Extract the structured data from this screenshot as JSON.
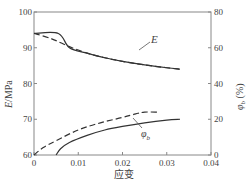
{
  "chart_data": {
    "type": "line",
    "title": "",
    "xlabel": "应变",
    "ylabel": "E/MPa",
    "ylabel_right": "φb (%)",
    "xlim": [
      0,
      0.04
    ],
    "ylim": [
      60,
      100
    ],
    "ylim_right": [
      0,
      80
    ],
    "x_ticks": [
      "0",
      "0.01",
      "0.02",
      "0.03",
      "0.04"
    ],
    "y_ticks": [
      "60",
      "70",
      "80",
      "90",
      "100"
    ],
    "y_ticks_right": [
      "0",
      "20",
      "40",
      "60",
      "80"
    ],
    "grid": false,
    "annotations": [
      "E",
      "φb"
    ],
    "series": [
      {
        "name": "E (solid)",
        "axis": "left",
        "style": "solid",
        "x": [
          0,
          0.0055,
          0.008,
          0.012,
          0.016,
          0.02,
          0.025,
          0.03,
          0.033
        ],
        "values": [
          94,
          94,
          90,
          88.5,
          87.2,
          86.2,
          85.2,
          84.4,
          84
        ]
      },
      {
        "name": "E (dashed)",
        "axis": "left",
        "style": "dashed",
        "x": [
          0,
          0.004,
          0.008,
          0.012,
          0.016,
          0.02,
          0.025,
          0.03,
          0.033
        ],
        "values": [
          94,
          92.5,
          90.3,
          88.5,
          87.2,
          86.2,
          85.2,
          84.4,
          84
        ]
      },
      {
        "name": "φb (dashed)",
        "axis": "right",
        "style": "dashed",
        "x": [
          0,
          0.002,
          0.005,
          0.01,
          0.015,
          0.02,
          0.023,
          0.025,
          0.028
        ],
        "values": [
          0,
          4,
          8,
          14,
          18,
          21,
          23,
          24,
          24
        ]
      },
      {
        "name": "φb (solid)",
        "axis": "right",
        "style": "solid",
        "x": [
          0.005,
          0.006,
          0.008,
          0.012,
          0.016,
          0.02,
          0.025,
          0.03,
          0.033
        ],
        "values": [
          0,
          3.5,
          7,
          11,
          14,
          16,
          18,
          19.5,
          20
        ]
      }
    ]
  },
  "labels": {
    "E_annotation": "E",
    "phi_annotation": "φ",
    "phi_sub": "b",
    "ylabel_left": "E/MPa",
    "ylabel_right_main": "φ",
    "ylabel_right_sub": "b",
    "ylabel_right_unit": " (%)",
    "xlabel": "应变"
  }
}
